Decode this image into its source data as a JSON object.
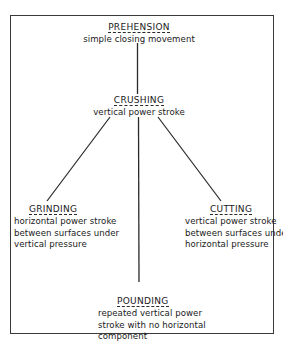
{
  "diagram": {
    "nodes": [
      {
        "id": "prehension",
        "title": "PREHENSION",
        "description": [
          "simple closing movement"
        ]
      },
      {
        "id": "crushing",
        "title": "CRUSHING",
        "description": [
          "vertical power stroke"
        ]
      },
      {
        "id": "grinding",
        "title": "GRINDING",
        "description": [
          "horizontal power stroke",
          "between surfaces under",
          "vertical pressure"
        ]
      },
      {
        "id": "cutting",
        "title": "CUTTING",
        "description": [
          "vertical power stroke",
          "between surfaces under",
          "horizontal pressure"
        ]
      },
      {
        "id": "pounding",
        "title": "POUNDING",
        "description": [
          "repeated vertical power",
          "stroke with no horizontal",
          "component"
        ]
      }
    ],
    "edges": [
      {
        "from": "prehension",
        "to": "crushing"
      },
      {
        "from": "crushing",
        "to": "grinding"
      },
      {
        "from": "crushing",
        "to": "pounding"
      },
      {
        "from": "crushing",
        "to": "cutting"
      }
    ],
    "colors": {
      "line": "#2a2a2a",
      "text": "#1a1a1a",
      "background": "#ffffff"
    }
  }
}
